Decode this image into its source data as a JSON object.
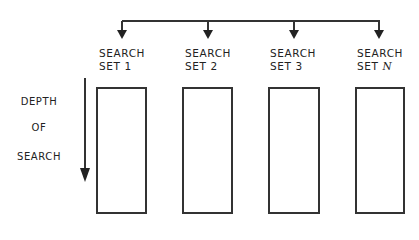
{
  "diagram": {
    "sets": [
      {
        "line1": "SEARCH",
        "line2": "SET 1"
      },
      {
        "line1": "SEARCH",
        "line2": "SET 2"
      },
      {
        "line1": "SEARCH",
        "line2": "SET 3"
      },
      {
        "line1": "SEARCH",
        "line2": "SET ",
        "suffix": "N"
      }
    ],
    "depth_label": [
      "DEPTH",
      "OF",
      "SEARCH"
    ],
    "colors": {
      "stroke": "#333333",
      "text": "#222222",
      "background": "#ffffff"
    }
  }
}
